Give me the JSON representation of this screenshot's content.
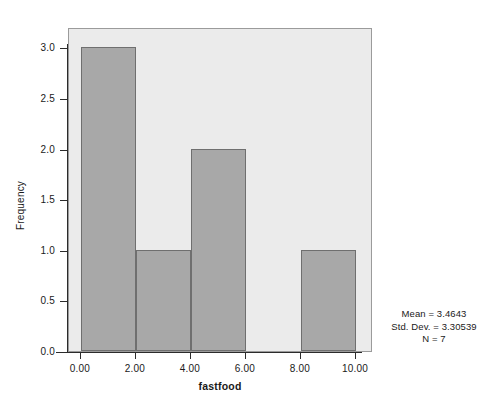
{
  "chart_data": {
    "type": "bar",
    "title": "",
    "subtitle": "",
    "xlabel": "fastfood",
    "ylabel": "Frequency",
    "categories": [
      "0.00-2.00",
      "2.00-4.00",
      "4.00-6.00",
      "6.00-8.00",
      "8.00-10.00"
    ],
    "bin_edges": [
      0,
      2,
      4,
      6,
      8,
      10
    ],
    "values": [
      3,
      1,
      2,
      0,
      1
    ],
    "xlim": [
      -0.45,
      10.6
    ],
    "ylim": [
      0,
      3.2
    ],
    "x_ticks": [
      0,
      2,
      4,
      6,
      8,
      10
    ],
    "x_tick_labels": [
      "0.00",
      "2.00",
      "4.00",
      "6.00",
      "8.00",
      "10.00"
    ],
    "y_ticks": [
      0,
      0.5,
      1,
      1.5,
      2,
      2.5,
      3
    ],
    "y_tick_labels": [
      "0.0",
      "0.5",
      "1.0",
      "1.5",
      "2.0",
      "2.5",
      "3.0"
    ],
    "grid": false,
    "legend": null,
    "bar_color": "#a8a8a8",
    "bar_edge_color": "#6f6f6f",
    "plot_background": "#ebebeb",
    "page_background": "#ffffff",
    "annotations": [
      "Mean = 3.4643",
      "Std. Dev. = 3.30539",
      "N = 7"
    ]
  },
  "stats": {
    "mean_line": "Mean = 3.4643",
    "stddev_line": "Std. Dev. = 3.30539",
    "n_line": "N = 7"
  }
}
